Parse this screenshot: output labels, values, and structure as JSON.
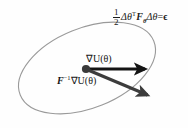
{
  "figure": {
    "name": "natural-gradient-trust-region-diagram",
    "background_color": "#fefefe"
  },
  "equation": {
    "fraction_numerator": "1",
    "fraction_denominator": "2",
    "delta_theta_transpose": "Δθ",
    "transpose_mark": "T",
    "fisher_symbol": "F",
    "fisher_subscript": "θ",
    "delta_theta": "Δθ",
    "equals": "=",
    "epsilon": "ϵ",
    "full_text": "1/2 Δθᵀ Fθ Δθ = ϵ"
  },
  "labels": {
    "gradient": "∇U(θ)",
    "natural_gradient_prefix": "F",
    "natural_gradient_exponent": "−1",
    "natural_gradient_suffix": "∇U(θ)"
  },
  "ellipse": {
    "stroke_color": "#9a9a9a",
    "fill": "none",
    "center_x": 87,
    "center_y": 68,
    "radius_x": 72,
    "radius_y": 40,
    "rotation_deg": -22
  },
  "origin_point": {
    "x": 86,
    "y": 69,
    "radius": 4,
    "color": "#3a3a3a"
  },
  "arrows": [
    {
      "name": "gradient-arrow",
      "x1": 88,
      "y1": 69,
      "x2": 147,
      "y2": 69,
      "color": "#141414",
      "width": 3
    },
    {
      "name": "natural-gradient-arrow",
      "x1": 88,
      "y1": 70,
      "x2": 150,
      "y2": 96,
      "color": "#3c3c3c",
      "width": 3
    }
  ]
}
